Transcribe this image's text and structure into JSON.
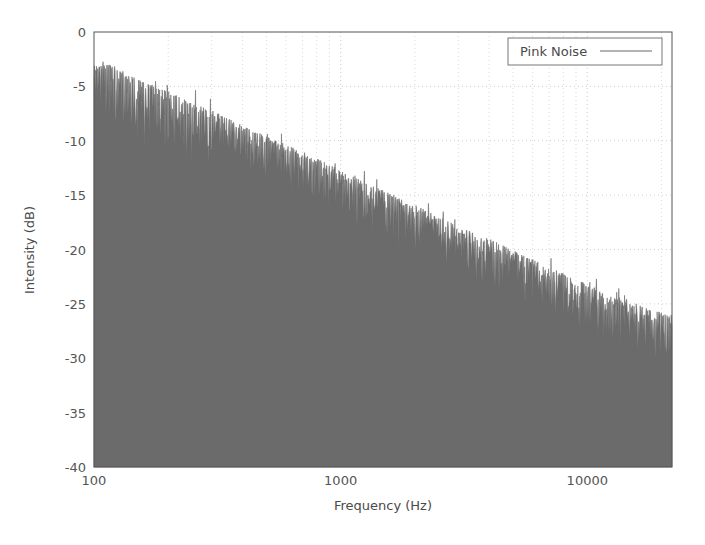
{
  "chart_data": {
    "type": "area",
    "title": "",
    "xlabel": "Frequency (Hz)",
    "ylabel": "Intensity (dB)",
    "xscale": "log",
    "yscale": "linear",
    "xlim": [
      100,
      22050
    ],
    "ylim": [
      -40,
      0
    ],
    "grid": true,
    "grid_style": "dotted",
    "grid_color": "#d9d9d9",
    "frame_color": "#555555",
    "background": "#ffffff",
    "legend": {
      "position": "top-right",
      "border": true,
      "entries": [
        {
          "name": "Pink Noise",
          "color": "#6b6b6b",
          "marker": "line"
        }
      ]
    },
    "xticks": [
      {
        "value": 100,
        "label": "100"
      },
      {
        "value": 1000,
        "label": "1000"
      },
      {
        "value": 10000,
        "label": "10000"
      }
    ],
    "xminor_ticks": [
      200,
      300,
      400,
      500,
      600,
      700,
      800,
      900,
      2000,
      3000,
      4000,
      5000,
      6000,
      7000,
      8000,
      9000,
      20000
    ],
    "yticks": [
      {
        "value": 0,
        "label": "0"
      },
      {
        "value": -5,
        "label": "-5"
      },
      {
        "value": -10,
        "label": "-10"
      },
      {
        "value": -15,
        "label": "-15"
      },
      {
        "value": -20,
        "label": "-20"
      },
      {
        "value": -25,
        "label": "-25"
      },
      {
        "value": -30,
        "label": "-30"
      },
      {
        "value": -35,
        "label": "-35"
      },
      {
        "value": -40,
        "label": "-40"
      }
    ],
    "series": [
      {
        "name": "Pink Noise",
        "color": "#6b6b6b",
        "fill_to": -40,
        "description": "Pink noise spectrum, roughly -3 dB per octave falling envelope with dense noisy fluctuation",
        "envelope": {
          "x": [
            100,
            120,
            150,
            180,
            200,
            250,
            300,
            400,
            500,
            600,
            700,
            800,
            900,
            1000,
            1200,
            1500,
            2000,
            2500,
            3000,
            4000,
            5000,
            6000,
            7000,
            8000,
            10000,
            12000,
            15000,
            18000,
            20000,
            22050
          ],
          "y": [
            -3.1,
            -3.0,
            -4.3,
            -5.2,
            -5.4,
            -6.6,
            -7.2,
            -8.6,
            -9.6,
            -10.4,
            -11.0,
            -11.6,
            -12.2,
            -12.7,
            -13.6,
            -14.6,
            -15.9,
            -17.0,
            -17.8,
            -19.0,
            -20.1,
            -20.9,
            -21.6,
            -22.2,
            -23.2,
            -24.0,
            -24.8,
            -25.5,
            -25.8,
            -26.3
          ]
        },
        "noise_amplitude_db": 2.4,
        "n_points": 1400
      }
    ]
  },
  "plot_geometry": {
    "left": 94,
    "right": 672,
    "top": 32,
    "bottom": 467
  }
}
